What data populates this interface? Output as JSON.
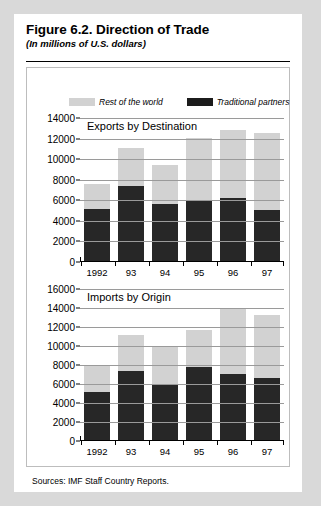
{
  "figure": {
    "title": "Figure 6.2.  Direction of Trade",
    "subtitle": "(In millions of U.S. dollars)",
    "source": "Sources:  IMF Staff Country Reports."
  },
  "legend": {
    "items": [
      {
        "label": "Rest of the world",
        "color": "#d2d2d2",
        "name": "rest-of-world"
      },
      {
        "label": "Traditional partners",
        "color": "#1c1c1c",
        "name": "traditional-partners"
      }
    ]
  },
  "colors": {
    "light": "#d2d2d2",
    "dark": "#272727",
    "page_background": "#d9d9d9",
    "card_background": "#ffffff",
    "gridline": "#9a9a9a",
    "axis": "#000000"
  },
  "chart_data": [
    {
      "id": "exports",
      "type": "bar",
      "stacked": true,
      "title": "Exports by Destination",
      "xlabel": "",
      "ylabel": "",
      "ylim": [
        0,
        14000
      ],
      "ytick_step": 2000,
      "yticks": [
        0,
        2000,
        4000,
        6000,
        8000,
        10000,
        12000,
        14000
      ],
      "ytick_labels": [
        "0",
        "2000",
        "4000",
        "6000",
        "8000",
        "10000",
        "12000",
        "14000"
      ],
      "grid": true,
      "legend_position": "top",
      "categories": [
        "1992",
        "93",
        "94",
        "95",
        "96",
        "97"
      ],
      "series": [
        {
          "name": "Traditional partners",
          "color": "#272727",
          "values": [
            5200,
            7400,
            5650,
            6000,
            6200,
            5100
          ]
        },
        {
          "name": "Rest of the world",
          "color": "#d2d2d2",
          "values": [
            2400,
            3700,
            3750,
            6100,
            6600,
            7450
          ]
        }
      ],
      "totals": [
        7600,
        11100,
        9400,
        12100,
        12800,
        12550
      ]
    },
    {
      "id": "imports",
      "type": "bar",
      "stacked": true,
      "title": "Imports by Origin",
      "xlabel": "",
      "ylabel": "",
      "ylim": [
        0,
        16000
      ],
      "ytick_step": 2000,
      "yticks": [
        0,
        2000,
        4000,
        6000,
        8000,
        10000,
        12000,
        14000,
        16000
      ],
      "ytick_labels": [
        "0",
        "2000",
        "4000",
        "6000",
        "8000",
        "10000",
        "12000",
        "14000",
        "16000"
      ],
      "grid": true,
      "legend_position": "top",
      "categories": [
        "1992",
        "93",
        "94",
        "95",
        "96",
        "97"
      ],
      "series": [
        {
          "name": "Traditional partners",
          "color": "#272727",
          "values": [
            5200,
            7400,
            6050,
            7800,
            7050,
            6600
          ]
        },
        {
          "name": "Rest of the world",
          "color": "#d2d2d2",
          "values": [
            2700,
            3800,
            3850,
            3900,
            6950,
            6700
          ]
        }
      ],
      "totals": [
        7900,
        11200,
        9900,
        11700,
        14000,
        13300
      ]
    }
  ]
}
